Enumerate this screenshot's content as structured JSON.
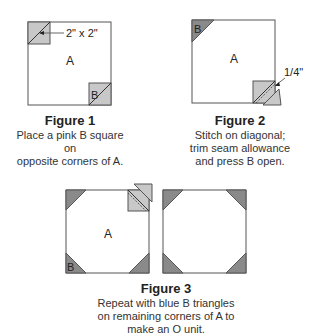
{
  "figures": [
    {
      "title": "Figure 1",
      "caption_lines": [
        "Place a pink B square on",
        "opposite corners of A."
      ],
      "labels": {
        "main": "A",
        "corner": "B",
        "dimension": "2\" x 2\""
      }
    },
    {
      "title": "Figure 2",
      "caption_lines": [
        "Stitch on diagonal;",
        "trim seam allowance",
        "and press B open."
      ],
      "labels": {
        "main": "A",
        "corner": "B",
        "seam": "1/4\""
      }
    },
    {
      "title": "Figure 3",
      "caption_lines": [
        "Repeat with blue B triangles",
        "on remaining corners of A to",
        "make an O unit."
      ],
      "labels": {
        "main": "A",
        "corner": "B"
      }
    }
  ],
  "colors": {
    "light_fill": "#c8c8c8",
    "dark_fill": "#8a8a8a",
    "outline": "#555555"
  }
}
